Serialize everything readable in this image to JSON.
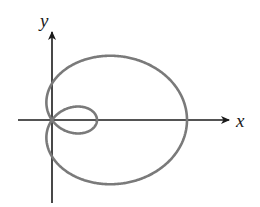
{
  "figure": {
    "type": "polar-curve",
    "curve_name": "limacon with inner loop",
    "equation": "r = 1 + 2cos(theta)",
    "axes": {
      "x_label": "x",
      "y_label": "y"
    },
    "colors": {
      "curve": "#7a7a7a",
      "axis": "#1a1a1a",
      "background": "#ffffff"
    }
  }
}
